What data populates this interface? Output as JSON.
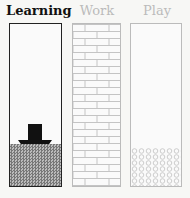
{
  "columns": [
    {
      "label": "Learning",
      "state": "active",
      "fill_pattern": "dense-dither",
      "indicator": "down-arrow"
    },
    {
      "label": "Work",
      "state": "inactive",
      "fill_pattern": "brick"
    },
    {
      "label": "Play",
      "state": "inactive",
      "fill_pattern": "circles"
    }
  ],
  "colors": {
    "active_text": "#111111",
    "inactive_text": "#bbbbbb",
    "active_border": "#222222",
    "inactive_border": "#bbbbbb"
  }
}
